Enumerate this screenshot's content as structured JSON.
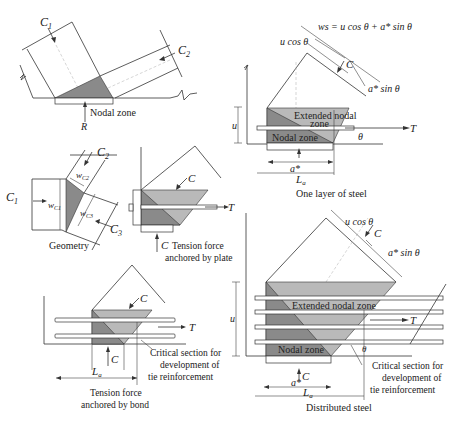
{
  "colors": {
    "nodal_zone": "#8a8a8a",
    "extended_nodal_zone": "#b9b9b9",
    "line": "#333333",
    "background": "#ffffff"
  },
  "panels": {
    "cct_node": {
      "forces": [
        "C1",
        "C2"
      ],
      "reaction": "R",
      "label": "Nodal zone"
    },
    "geometry": {
      "caption": "Geometry",
      "forces": [
        "C1",
        "C2",
        "C3"
      ],
      "widths": [
        "wC1",
        "wC2",
        "wC3"
      ]
    },
    "plate": {
      "caption_line1": "Tension force",
      "caption_line2": "anchored by plate",
      "force_c": "C",
      "force_c_bottom": "C",
      "force_t": "T"
    },
    "bond": {
      "caption_line1": "Tension force",
      "caption_line2": "anchored by bond",
      "force_c": "C",
      "force_c_bottom": "C",
      "force_t": "T",
      "la": "La",
      "critical_line1": "Critical section for",
      "critical_line2": "development of",
      "critical_line3": "tie reinforcement"
    },
    "one_layer": {
      "caption": "One layer of steel",
      "ws_formula": "ws = u cos θ + a* sin θ",
      "u_cos": "u cos θ",
      "a_sin": "a* sin θ",
      "force_c": "C",
      "force_t": "T",
      "extended_line1": "Extended nodal",
      "extended_line2": "zone",
      "nodal": "Nodal zone",
      "theta": "θ",
      "u": "u",
      "a_star": "a*",
      "la": "La"
    },
    "distributed": {
      "caption": "Distributed steel",
      "u_cos": "u cos θ",
      "a_sin": "a* sin θ",
      "force_c": "C",
      "force_c_bottom": "C",
      "force_t": "T",
      "extended": "Extended nodal zone",
      "nodal": "Nodal zone",
      "theta": "θ",
      "u": "u",
      "a_star": "a*",
      "la": "La",
      "critical_line1": "Critical section for",
      "critical_line2": "development of",
      "critical_line3": "tie reinforcement"
    }
  }
}
